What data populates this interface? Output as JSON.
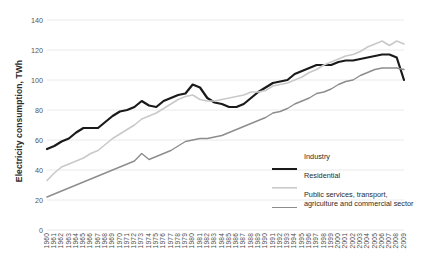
{
  "chart_data": {
    "type": "line",
    "title": "",
    "xlabel": "",
    "ylabel": "Electricity consumption, TWh",
    "ylim": [
      0,
      140
    ],
    "yticks": [
      0,
      20,
      40,
      60,
      80,
      100,
      120,
      140
    ],
    "grid": "horizontal",
    "legend_position": "right",
    "x": [
      1960,
      1961,
      1962,
      1963,
      1964,
      1965,
      1966,
      1967,
      1968,
      1969,
      1970,
      1971,
      1972,
      1973,
      1974,
      1975,
      1976,
      1977,
      1978,
      1979,
      1980,
      1981,
      1982,
      1983,
      1984,
      1985,
      1986,
      1987,
      1988,
      1989,
      1990,
      1991,
      1992,
      1993,
      1994,
      1995,
      1996,
      1997,
      1998,
      1999,
      2000,
      2001,
      2002,
      2003,
      2004,
      2005,
      2006,
      2007,
      2008,
      2009
    ],
    "series": [
      {
        "name": "Industry",
        "color": "#1a1a1a",
        "width": 2.2,
        "values": [
          54,
          56,
          59,
          61,
          65,
          68,
          68,
          68,
          72,
          76,
          79,
          80,
          82,
          86,
          83,
          82,
          86,
          88,
          90,
          91,
          97,
          95,
          88,
          85,
          84,
          82,
          82,
          84,
          88,
          92,
          95,
          98,
          99,
          100,
          104,
          106,
          108,
          110,
          110,
          110,
          112,
          113,
          113,
          114,
          115,
          116,
          117,
          117,
          115,
          100
        ]
      },
      {
        "name": "Residential",
        "color": "#c9c9c9",
        "width": 1.6,
        "values": [
          33,
          38,
          42,
          44,
          46,
          48,
          51,
          53,
          57,
          61,
          64,
          67,
          70,
          74,
          76,
          78,
          81,
          84,
          87,
          89,
          90,
          87,
          86,
          86,
          87,
          88,
          89,
          90,
          92,
          92,
          93,
          96,
          97,
          98,
          100,
          102,
          105,
          107,
          110,
          112,
          114,
          116,
          117,
          119,
          122,
          124,
          126,
          123,
          126,
          124
        ]
      },
      {
        "name": "Public services, transport, agriculture and commercial sector",
        "color": "#8d8d8d",
        "width": 1.4,
        "values": [
          22,
          24,
          26,
          28,
          30,
          32,
          34,
          36,
          38,
          40,
          42,
          44,
          46,
          51,
          47,
          49,
          51,
          53,
          56,
          59,
          60,
          61,
          61,
          62,
          63,
          65,
          67,
          69,
          71,
          73,
          75,
          78,
          79,
          81,
          84,
          86,
          88,
          91,
          92,
          94,
          97,
          99,
          100,
          103,
          105,
          107,
          108,
          108,
          108,
          107
        ]
      }
    ]
  },
  "legend": {
    "items": [
      {
        "label": "Industry"
      },
      {
        "label": "Residential"
      },
      {
        "label": "Public services, transport, agriculture and commercial sector"
      }
    ]
  }
}
